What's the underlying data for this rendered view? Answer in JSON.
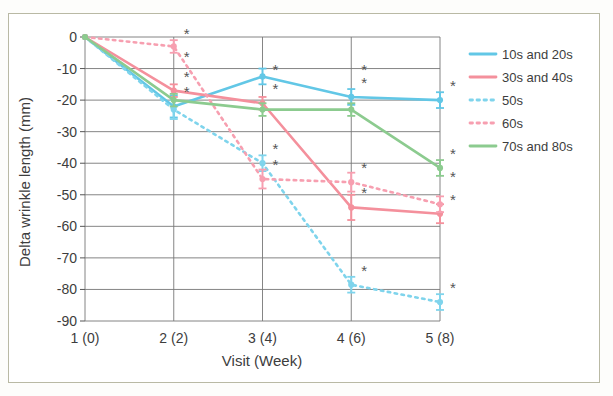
{
  "chart_data": {
    "type": "line",
    "title": "",
    "xlabel": "Visit (Week)",
    "ylabel": "Delta wrinkle length (mm)",
    "categories": [
      "1 (0)",
      "2 (2)",
      "3 (4)",
      "4 (6)",
      "5 (8)"
    ],
    "x": [
      1,
      2,
      3,
      4,
      5
    ],
    "ylim": [
      -90,
      0
    ],
    "yticks": [
      0,
      -10,
      -20,
      -30,
      -40,
      -50,
      -60,
      -70,
      -80,
      -90
    ],
    "ytick_labels": [
      "0",
      "-10",
      "-20",
      "-30",
      "-40",
      "-50",
      "-60",
      "-70",
      "-80",
      "-90"
    ],
    "grid": true,
    "legend_position": "right",
    "series": [
      {
        "name": "10s and 20s",
        "color": "#62C7E6",
        "style": "solid",
        "values": [
          0,
          -22,
          -12.5,
          -19,
          -20
        ],
        "errors": [
          0,
          3.5,
          2.5,
          2.5,
          2.5
        ],
        "significance": [
          false,
          true,
          false,
          true,
          true
        ]
      },
      {
        "name": "30s and 40s",
        "color": "#F4909C",
        "style": "solid",
        "values": [
          0,
          -17,
          -21,
          -54,
          -56
        ],
        "errors": [
          0,
          2,
          2,
          4,
          3
        ],
        "significance": [
          false,
          true,
          true,
          true,
          true
        ]
      },
      {
        "name": "50s",
        "color": "#7FD4EC",
        "style": "dotted",
        "values": [
          0,
          -23,
          -40,
          -78.5,
          -84
        ],
        "errors": [
          0,
          3,
          2.5,
          2.5,
          2.5
        ],
        "significance": [
          false,
          true,
          true,
          true,
          true
        ]
      },
      {
        "name": "60s",
        "color": "#F79FB0",
        "style": "dotted",
        "values": [
          0,
          -3,
          -45,
          -46,
          -53
        ],
        "errors": [
          0,
          2,
          3,
          3,
          2.5
        ],
        "significance": [
          false,
          false,
          true,
          true,
          true
        ]
      },
      {
        "name": "70s and 80s",
        "color": "#8CCB8F",
        "style": "solid",
        "values": [
          0,
          -20,
          -23,
          -23,
          -41.5
        ],
        "errors": [
          0,
          2,
          2,
          2,
          2.5
        ],
        "significance": [
          false,
          true,
          true,
          true,
          true
        ]
      }
    ],
    "annotations": {
      "significance_marker": "*"
    }
  }
}
